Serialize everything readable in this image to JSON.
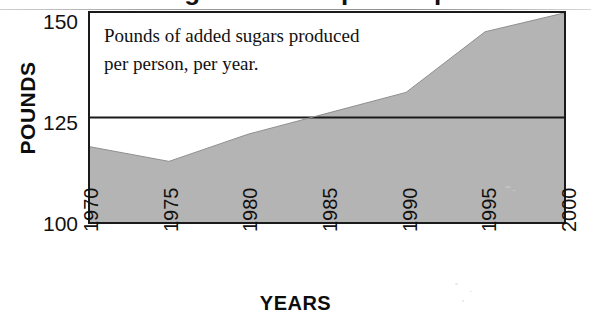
{
  "title_fragment": "Sugar Consumption Up",
  "chart_data": {
    "type": "area",
    "title": "",
    "xlabel": "YEARS",
    "ylabel": "POUNDS",
    "x": [
      1970,
      1975,
      1980,
      1985,
      1990,
      1995,
      2000
    ],
    "values": [
      118,
      114.5,
      121,
      126,
      131,
      145.5,
      150
    ],
    "series": [
      {
        "name": "Pounds of added sugars produced per person, per year",
        "values": [
          118,
          114.5,
          121,
          126,
          131,
          145.5,
          150
        ]
      }
    ],
    "categories": [
      "1970",
      "1975",
      "1980",
      "1985",
      "1990",
      "1995",
      "2000"
    ],
    "xtick_labels": [
      "1970",
      "1975",
      "1980",
      "1985",
      "1990",
      "1995",
      "2000"
    ],
    "ytick_labels": [
      "100",
      "125",
      "150"
    ],
    "ytick_values": [
      100,
      125,
      150
    ],
    "xlim": [
      1970,
      2000
    ],
    "ylim": [
      100,
      150
    ],
    "grid": true,
    "gridlines_y": [
      125
    ],
    "legend": "none",
    "annotations": [
      "Pounds of added sugars produced",
      "per person, per year."
    ],
    "area_fill_color": "#b4b4b4",
    "line_color": "#1a1a1a",
    "frame_color": "#1a1a1a",
    "background_color": "#ffffff"
  },
  "axes": {
    "y": {
      "title": "POUNDS",
      "ticks": [
        {
          "label": "150",
          "value": 150
        },
        {
          "label": "125",
          "value": 125
        },
        {
          "label": "100",
          "value": 100
        }
      ]
    },
    "x": {
      "title": "YEARS",
      "ticks": [
        {
          "label": "1970",
          "value": 1970
        },
        {
          "label": "1975",
          "value": 1975
        },
        {
          "label": "1980",
          "value": 1980
        },
        {
          "label": "1985",
          "value": 1985
        },
        {
          "label": "1990",
          "value": 1990
        },
        {
          "label": "1995",
          "value": 1995
        },
        {
          "label": "2000",
          "value": 2000
        }
      ]
    }
  },
  "caption": {
    "line1": "Pounds of added sugars produced",
    "line2": "per person, per year."
  }
}
